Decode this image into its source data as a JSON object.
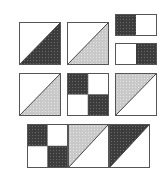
{
  "colors": {
    "dark": "#3c3c3c",
    "dark_speck": "#6a6a6a",
    "light": "#c9c9c9",
    "light_speck": "#e4e4e4",
    "white": "#ffffff",
    "outline": "#555555"
  },
  "blocks": [
    {
      "id": "hst-dark-1",
      "type": "half-square-triangle",
      "fill": "dark",
      "x": 19,
      "y": 22,
      "w": 42,
      "h": 43,
      "filled_half": "lower-right"
    },
    {
      "id": "hst-light-1",
      "type": "half-square-triangle",
      "fill": "light",
      "x": 67,
      "y": 22,
      "w": 42,
      "h": 43,
      "filled_half": "lower-right"
    },
    {
      "id": "two-patch-1",
      "type": "two-patch",
      "x": 115,
      "y": 14,
      "w": 42,
      "h": 22,
      "left": "dark",
      "right": "white"
    },
    {
      "id": "two-patch-2",
      "type": "two-patch",
      "x": 115,
      "y": 43,
      "w": 42,
      "h": 22,
      "left": "white",
      "right": "dark"
    },
    {
      "id": "hst-light-2",
      "type": "half-square-triangle",
      "fill": "light",
      "x": 19,
      "y": 73,
      "w": 42,
      "h": 43,
      "filled_half": "lower-right"
    },
    {
      "id": "four-patch-1",
      "type": "four-patch",
      "x": 67,
      "y": 73,
      "w": 42,
      "h": 43,
      "cells": [
        "dark",
        "white",
        "white",
        "dark"
      ]
    },
    {
      "id": "hst-light-3",
      "type": "half-square-triangle",
      "fill": "light",
      "x": 115,
      "y": 73,
      "w": 42,
      "h": 43,
      "filled_half": "upper-left"
    },
    {
      "id": "four-patch-2",
      "type": "four-patch",
      "x": 27,
      "y": 124,
      "w": 41,
      "h": 44,
      "cells": [
        "dark",
        "white",
        "white",
        "dark"
      ]
    },
    {
      "id": "hst-light-4",
      "type": "half-square-triangle",
      "fill": "light",
      "x": 68,
      "y": 124,
      "w": 41,
      "h": 44,
      "filled_half": "upper-left"
    },
    {
      "id": "hst-dark-2",
      "type": "half-square-triangle",
      "fill": "dark",
      "x": 109,
      "y": 124,
      "w": 41,
      "h": 44,
      "filled_half": "upper-left"
    }
  ]
}
